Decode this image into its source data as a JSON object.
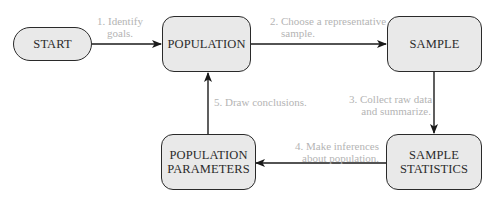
{
  "nodes": {
    "start": "START",
    "population": "POPULATION",
    "sample": "SAMPLE",
    "sample_statistics": [
      "SAMPLE",
      "STATISTICS"
    ],
    "population_parameters": [
      "POPULATION",
      "PARAMETERS"
    ]
  },
  "steps": {
    "step1": [
      "1. Identify",
      "goals."
    ],
    "step2": [
      "2. Choose a representative",
      "sample."
    ],
    "step3": [
      "3. Collect raw data",
      "and summarize."
    ],
    "step4": [
      "4. Make inferences",
      "about population."
    ],
    "step5": "5. Draw conclusions."
  },
  "colors": {
    "box_fill": "#e9e9e9",
    "box_border": "#2a2a2a",
    "label_text": "#b4b4b4",
    "arrow": "#1a1a1a"
  }
}
